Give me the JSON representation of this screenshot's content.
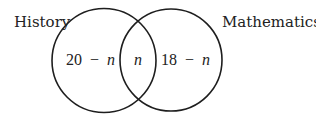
{
  "diagram": {
    "type": "venn",
    "sets": [
      {
        "name": "History",
        "label": "History",
        "color": "#1e1e1e"
      },
      {
        "name": "Mathematics",
        "label": "Mathematics",
        "color": "#1e1e1e"
      }
    ],
    "regions": {
      "history_only": {
        "number": "20",
        "operator": "−",
        "variable": "n"
      },
      "intersection": {
        "variable": "n"
      },
      "mathematics_only": {
        "number": "18",
        "operator": "−",
        "variable": "n"
      }
    }
  }
}
